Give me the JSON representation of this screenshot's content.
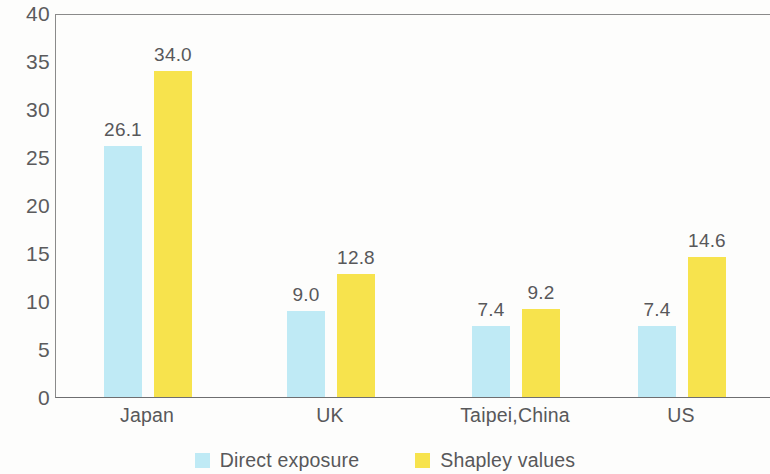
{
  "chart_data": {
    "type": "bar",
    "title": "",
    "subtitle": "",
    "xlabel": "",
    "ylabel": "",
    "categories": [
      "Japan",
      "UK",
      "Taipei,China",
      "US"
    ],
    "series": [
      {
        "name": "Direct exposure",
        "color": "#bfeaf5",
        "values": [
          26.1,
          9.0,
          7.4,
          7.4
        ],
        "labels": [
          "26.1",
          "9.0",
          "7.4",
          "7.4"
        ]
      },
      {
        "name": "Shapley values",
        "color": "#f7e34d",
        "values": [
          34.0,
          12.8,
          9.2,
          14.6
        ],
        "labels": [
          "34.0",
          "12.8",
          "9.2",
          "14.6"
        ]
      }
    ],
    "ylim": [
      0,
      40
    ],
    "ytick_step": 5,
    "yticks": [
      "40",
      "35",
      "30",
      "25",
      "20",
      "15",
      "10",
      "5",
      "0"
    ],
    "ytick_values": [
      40,
      35,
      30,
      25,
      20,
      15,
      10,
      5,
      0
    ],
    "grid": false,
    "legend_position": "bottom"
  },
  "legend": {
    "items": [
      {
        "label": "Direct exposure",
        "color": "#bfeaf5"
      },
      {
        "label": "Shapley values",
        "color": "#f7e34d"
      }
    ]
  },
  "layout": {
    "group_centers_px": [
      147,
      330,
      515,
      681
    ],
    "plot_left_px": 55,
    "plot_top_px": 14,
    "plot_bottom_px": 398,
    "plot_right_px": 770,
    "bar_width_px": 38,
    "bar_gap_px": 12
  },
  "colors": {
    "axis": "#6e6e70",
    "text": "#58585a",
    "background": "#fdfdfc"
  }
}
